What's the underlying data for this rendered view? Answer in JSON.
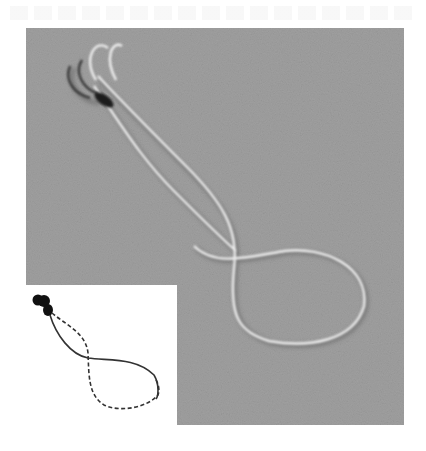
{
  "figure": {
    "panel": {
      "background_color": "#9d9d9d",
      "flagellum_highlight_color": "#f2f2f2",
      "flagellum_shadow_color": "#6e6e6e",
      "cell_body_color": "#1e1e1e"
    },
    "inset": {
      "background_color": "#ffffff",
      "body_color": "#111111",
      "solid_trace_color": "#333333",
      "dashed_trace_color": "#333333",
      "legend": {
        "solid_line": "trace segment (solid)",
        "dashed_line": "trace segment (dashed)"
      }
    }
  }
}
